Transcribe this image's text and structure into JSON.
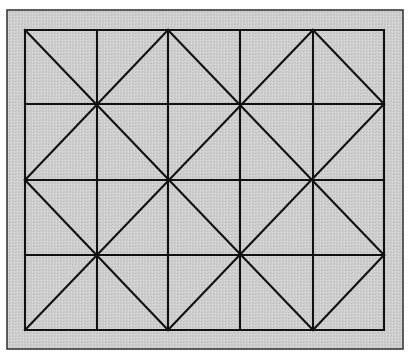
{
  "diagram": {
    "title": "Square grid with diagonal diamond lattice",
    "canvas": {
      "width": 419,
      "height": 358,
      "background": "#ffffff"
    },
    "frame": {
      "x": 7,
      "y": 10,
      "width": 396,
      "height": 339,
      "fill": "#cdcdcd",
      "stroke": "#3a3a3a",
      "stroke_width": 1.6
    },
    "grid": {
      "columns_x": [
        25,
        97,
        168,
        240,
        313,
        384
      ],
      "rows_y": [
        30,
        104,
        180,
        255,
        330
      ],
      "stroke": "#111111",
      "stroke_width": 2.1
    },
    "diagonals": {
      "stroke": "#111111",
      "stroke_width": 2.1,
      "segments": [
        {
          "from": [
            0,
            0
          ],
          "to": [
            4,
            4
          ]
        },
        {
          "from": [
            2,
            0
          ],
          "to": [
            5,
            3
          ]
        },
        {
          "from": [
            0,
            2
          ],
          "to": [
            2,
            4
          ]
        },
        {
          "from": [
            4,
            0
          ],
          "to": [
            5,
            1
          ]
        },
        {
          "from": [
            0,
            2
          ],
          "to": [
            2,
            0
          ]
        },
        {
          "from": [
            0,
            4
          ],
          "to": [
            4,
            0
          ]
        },
        {
          "from": [
            2,
            4
          ],
          "to": [
            5,
            1
          ]
        },
        {
          "from": [
            4,
            4
          ],
          "to": [
            5,
            3
          ]
        }
      ]
    }
  }
}
